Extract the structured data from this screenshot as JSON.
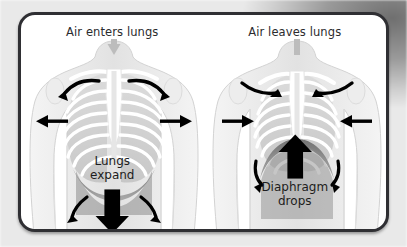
{
  "diagram": {
    "title_left": "Air enters lungs",
    "title_right": "Air leaves lungs",
    "panels": [
      {
        "id": "inhalation",
        "caption": "Air enters lungs",
        "label_line1": "Lungs",
        "label_line2": "expand",
        "trachea_airflow_direction": "down",
        "ribcage_arrows": "outward",
        "shoulder_arrows": "up-and-outward",
        "diaphragm_arrow_direction": "down",
        "diaphragm_arrow_position": "below-label"
      },
      {
        "id": "exhalation",
        "caption": "Air leaves lungs",
        "label_line1": "Diaphragm",
        "label_line2": "drops",
        "trachea_airflow_direction": "up",
        "ribcage_arrows": "inward",
        "shoulder_arrows": "down-and-inward",
        "diaphragm_arrow_direction": "up",
        "diaphragm_arrow_position": "above-label"
      }
    ],
    "icons": {
      "airflow_arrow": "airflow-arrow-icon",
      "rib_expansion_arrow": "rib-expansion-arrow-icon",
      "shoulder_arrow": "shoulder-curved-arrow-icon",
      "diaphragm_arrow": "diaphragm-arrow-icon"
    },
    "colors": {
      "border": "#2f2f33",
      "card_background": "#ffffff",
      "text": "#1d1d20",
      "arrow": "#000000",
      "airflow_arrow": "#b8b8b8",
      "torso": "#e8e8e8",
      "rib": "#ffffff",
      "diaphragm": "#8a8a8a"
    }
  }
}
